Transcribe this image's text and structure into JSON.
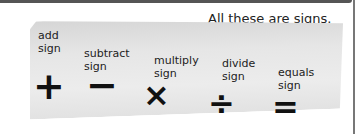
{
  "caption": "All these are signs.",
  "signs": [
    {
      "name": "add sign",
      "line1": "add",
      "line2": "sign",
      "symbol": "+"
    },
    {
      "name": "subtract sign",
      "line1": "subtract",
      "line2": "sign",
      "symbol": "−"
    },
    {
      "name": "multiply sign",
      "line1": "multiply",
      "line2": "sign",
      "symbol": "×"
    },
    {
      "name": "divide sign",
      "line1": "divide",
      "line2": "sign",
      "symbol": "÷"
    },
    {
      "name": "equals sign",
      "line1": "equals",
      "line2": "sign",
      "symbol": "="
    }
  ]
}
